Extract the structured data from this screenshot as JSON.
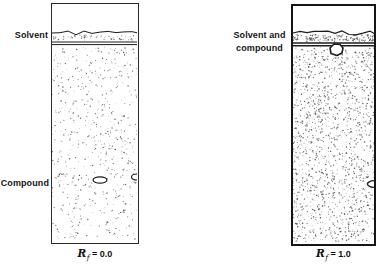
{
  "figure": {
    "left_panel": {
      "solvent_label": "Solvent",
      "compound_label": "Compound",
      "rf": {
        "symbol": "R",
        "subscript": "f",
        "value": "= 0.0"
      }
    },
    "right_panel": {
      "label_line1": "Solvent and",
      "label_line2": "compound",
      "rf": {
        "symbol": "R",
        "subscript": "f",
        "value": "= 1.0"
      }
    },
    "colors": {
      "ink": "#1c1c1c",
      "stipple": "#4a4a4a",
      "background": "#ffffff"
    }
  }
}
